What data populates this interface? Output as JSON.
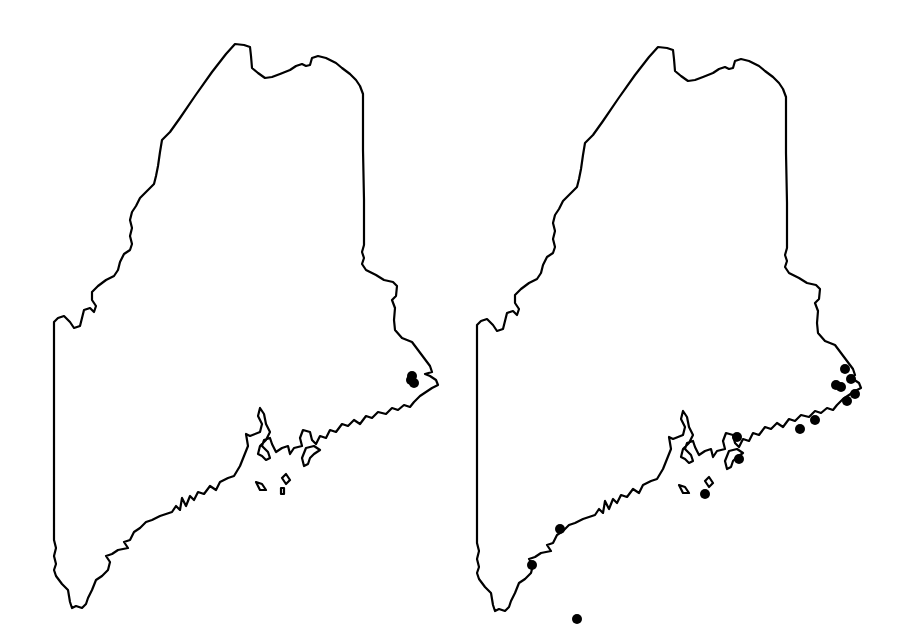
{
  "figure": {
    "colors": {
      "background": "#ffffff",
      "outline": "#000000",
      "dot": "#000000"
    }
  },
  "maps": [
    {
      "id": "left",
      "label": "",
      "offset": [
        0,
        0
      ],
      "dots": [
        [
          412,
          376
        ],
        [
          414,
          383
        ],
        [
          411,
          380
        ]
      ]
    },
    {
      "id": "right",
      "label": "",
      "offset": [
        423,
        3
      ],
      "dots": [
        [
          845,
          369
        ],
        [
          851,
          379
        ],
        [
          836,
          385
        ],
        [
          841,
          387
        ],
        [
          855,
          394
        ],
        [
          847,
          401
        ],
        [
          815,
          420
        ],
        [
          800,
          429
        ],
        [
          737,
          437
        ],
        [
          739,
          459
        ],
        [
          705,
          494
        ],
        [
          560,
          529
        ],
        [
          532,
          565
        ],
        [
          577,
          619
        ]
      ]
    }
  ]
}
